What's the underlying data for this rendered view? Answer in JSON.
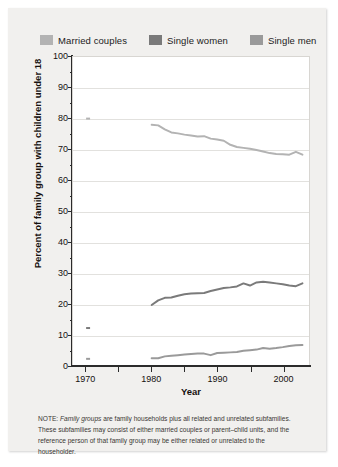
{
  "legend": {
    "items": [
      {
        "label": "Married couples",
        "color": "#b3b3b3"
      },
      {
        "label": "Single women",
        "color": "#7a7a7a"
      },
      {
        "label": "Single men",
        "color": "#9a9a9a"
      }
    ]
  },
  "note": {
    "prefix": "NOTE: ",
    "italic": "Family groups",
    "text": " are family households plus all related and unrelated subfamilies. These subfamilies may consist of either married couples or parent–child units, and the reference person of that family group may be either related or unrelated to the householder."
  },
  "chart_data": {
    "type": "line",
    "title": "",
    "xlabel": "Year",
    "ylabel": "Percent of family group with children under 18",
    "xlim": [
      1968,
      2004
    ],
    "ylim": [
      0,
      100
    ],
    "grid": true,
    "legend_position": "top",
    "xticks": [
      1970,
      1975,
      1980,
      1985,
      1990,
      1995,
      2000,
      2005
    ],
    "xtick_labels": [
      "1970",
      "",
      "1980",
      "",
      "1990",
      "",
      "2000",
      ""
    ],
    "yticks": [
      0,
      10,
      20,
      30,
      40,
      50,
      60,
      70,
      80,
      90,
      100
    ],
    "ytick_labels": [
      "0",
      "10",
      "20",
      "30",
      "40",
      "50",
      "60",
      "70",
      "80",
      "90",
      "100"
    ],
    "series": [
      {
        "name": "Married couples",
        "color": "#b3b3b3",
        "anchor_1970": 80,
        "x": [
          1980,
          1981,
          1982,
          1983,
          1984,
          1985,
          1986,
          1987,
          1988,
          1989,
          1990,
          1991,
          1992,
          1993,
          1994,
          1995,
          1996,
          1997,
          1998,
          1999,
          2000,
          2001,
          2002,
          2003
        ],
        "values": [
          78,
          77.8,
          76.5,
          75.5,
          75.2,
          74.8,
          74.5,
          74.2,
          74.3,
          73.5,
          73.2,
          72.8,
          71.5,
          70.8,
          70.5,
          70.2,
          69.8,
          69.3,
          68.8,
          68.5,
          68.4,
          68.3,
          69.2,
          68.3
        ]
      },
      {
        "name": "Single women",
        "color": "#7a7a7a",
        "anchor_1970": 12,
        "x": [
          1980,
          1981,
          1982,
          1983,
          1984,
          1985,
          1986,
          1987,
          1988,
          1989,
          1990,
          1991,
          1992,
          1993,
          1994,
          1995,
          1996,
          1997,
          1998,
          1999,
          2000,
          2001,
          2002,
          2003
        ],
        "values": [
          19.5,
          21,
          21.8,
          21.9,
          22.5,
          23,
          23.2,
          23.3,
          23.4,
          24,
          24.5,
          25,
          25.2,
          25.5,
          26.5,
          25.8,
          26.8,
          27,
          26.8,
          26.5,
          26.2,
          25.8,
          25.6,
          26.5
        ]
      },
      {
        "name": "Single men",
        "color": "#9a9a9a",
        "anchor_1970": 2,
        "x": [
          1980,
          1981,
          1982,
          1983,
          1984,
          1985,
          1986,
          1987,
          1988,
          1989,
          1990,
          1991,
          1992,
          1993,
          1994,
          1995,
          1996,
          1997,
          1998,
          1999,
          2000,
          2001,
          2002,
          2003
        ],
        "values": [
          2.2,
          2.2,
          2.8,
          3,
          3.2,
          3.4,
          3.6,
          3.7,
          3.7,
          3.2,
          3.9,
          4,
          4.1,
          4.2,
          4.6,
          4.8,
          5,
          5.5,
          5.3,
          5.5,
          5.8,
          6.2,
          6.4,
          6.5
        ]
      }
    ]
  }
}
